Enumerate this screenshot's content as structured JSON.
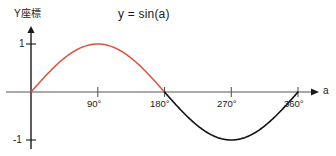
{
  "chart_data": {
    "type": "line",
    "title": "y = sin(a)",
    "xlabel": "a",
    "ylabel": "Y座標",
    "xlim": [
      0,
      360
    ],
    "ylim": [
      -1,
      1
    ],
    "grid": false,
    "legend": "none",
    "x_tick_labels": [
      "90°",
      "180°",
      "270°",
      "360°"
    ],
    "x_tick_values": [
      90,
      180,
      270,
      360
    ],
    "y_tick_labels": [
      "1",
      "-1"
    ],
    "y_tick_values": [
      1,
      -1
    ],
    "series": [
      {
        "name": "sin(a) positive half",
        "color": "#e0503a",
        "x": [
          0,
          10,
          20,
          30,
          40,
          50,
          60,
          70,
          80,
          90,
          100,
          110,
          120,
          130,
          140,
          150,
          160,
          170,
          180
        ],
        "y": [
          0,
          0.174,
          0.342,
          0.5,
          0.643,
          0.766,
          0.866,
          0.94,
          0.985,
          1,
          0.985,
          0.94,
          0.866,
          0.766,
          0.643,
          0.5,
          0.342,
          0.174,
          0
        ]
      },
      {
        "name": "sin(a) negative half",
        "color": "#111111",
        "x": [
          180,
          190,
          200,
          210,
          220,
          230,
          240,
          250,
          260,
          270,
          280,
          290,
          300,
          310,
          320,
          330,
          340,
          350,
          360
        ],
        "y": [
          0,
          -0.174,
          -0.342,
          -0.5,
          -0.643,
          -0.766,
          -0.866,
          -0.94,
          -0.985,
          -1,
          -0.985,
          -0.94,
          -0.866,
          -0.766,
          -0.643,
          -0.5,
          -0.342,
          -0.174,
          0
        ]
      }
    ],
    "axis_colors": {
      "x_axis": "#8c8c8c",
      "y_axis": "#1a1a1a"
    }
  },
  "title": "y = sin(a)",
  "axes": {
    "y_label": "Y座標",
    "x_label": "a"
  },
  "ticks": {
    "x": [
      {
        "label": "90°"
      },
      {
        "label": "180°"
      },
      {
        "label": "270°"
      },
      {
        "label": "360°"
      }
    ],
    "y": [
      {
        "label": "1"
      },
      {
        "label": "-1"
      }
    ]
  }
}
